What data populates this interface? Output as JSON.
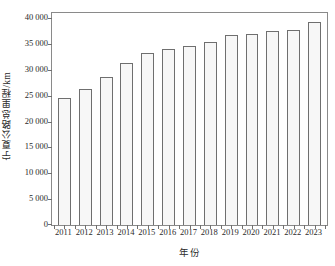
{
  "chart_data": {
    "type": "bar",
    "title": "",
    "xlabel": "年份",
    "ylabel": "宁夏公路总里程/km",
    "categories": [
      "2011",
      "2012",
      "2013",
      "2014",
      "2015",
      "2016",
      "2017",
      "2018",
      "2019",
      "2020",
      "2021",
      "2022",
      "2023"
    ],
    "values": [
      24500,
      26400,
      28600,
      31400,
      33300,
      34000,
      34600,
      35400,
      36700,
      37000,
      37600,
      37700,
      39200
    ],
    "ylim": [
      0,
      41000
    ],
    "yticks": [
      0,
      5000,
      10000,
      15000,
      20000,
      25000,
      30000,
      35000,
      40000
    ],
    "ytick_labels": [
      "0",
      "5 000",
      "10 000",
      "15 000",
      "20 000",
      "25 000",
      "30 000",
      "35 000",
      "40 000"
    ],
    "grid": false,
    "legend": false,
    "bar_fill_color": "#f7f7f7",
    "bar_edge_color": "#6f6f6f",
    "frame_color": "#8a8a8a",
    "background_color": "#ffffff"
  }
}
